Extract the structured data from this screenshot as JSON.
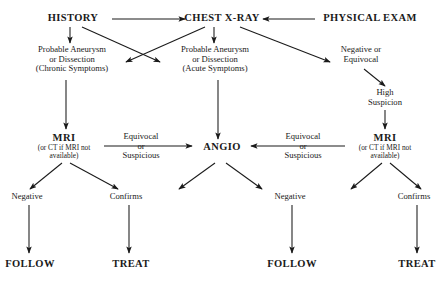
{
  "diagram": {
    "stroke_color": "#1a1a1a",
    "background_color": "#ffffff",
    "nodes": [
      {
        "id": "history",
        "label": "HISTORY",
        "x": 73,
        "y": 19,
        "style": "bold"
      },
      {
        "id": "chest-xray",
        "label": "CHEST X-RAY",
        "x": 222,
        "y": 19,
        "style": "bold"
      },
      {
        "id": "physical-exam",
        "label": "PHYSICAL EXAM",
        "x": 370,
        "y": 19,
        "style": "bold"
      },
      {
        "id": "chronic",
        "line1": "Probable Aneurysm",
        "line2": "or Dissection",
        "line3": "(Chronic Symptoms)",
        "x": 72,
        "y": 52,
        "style": "plain"
      },
      {
        "id": "acute",
        "line1": "Probable Aneurysm",
        "line2": "or Dissection",
        "line3": "(Acute Symptoms)",
        "x": 215,
        "y": 52,
        "style": "plain"
      },
      {
        "id": "negative-equiv",
        "line1": "Negative or",
        "line2": "Equivocal",
        "line3": "",
        "x": 361,
        "y": 52,
        "style": "plain"
      },
      {
        "id": "high-suspicion",
        "line1": "High",
        "line2": "Suspicion",
        "line3": "",
        "x": 385,
        "y": 93,
        "style": "plain"
      },
      {
        "id": "mri-left",
        "label": "MRI",
        "sub1": "(or CT if MRI not",
        "sub2": "available)",
        "x": 64,
        "y": 138,
        "style": "bold"
      },
      {
        "id": "angio",
        "label": "ANGIO",
        "sub1": "",
        "sub2": "",
        "x": 222,
        "y": 147,
        "style": "bold"
      },
      {
        "id": "mri-right",
        "label": "MRI",
        "sub1": "(or CT if MRI not",
        "sub2": "available)",
        "x": 385,
        "y": 138,
        "style": "bold"
      },
      {
        "id": "equiv-left",
        "line1": "Equivocal",
        "line2": "or",
        "line3": "Suspicious",
        "x": 141,
        "y": 138,
        "style": "plain"
      },
      {
        "id": "equiv-right",
        "line1": "Equivocal",
        "line2": "or",
        "line3": "Suspicious",
        "x": 303,
        "y": 138,
        "style": "plain"
      },
      {
        "id": "negative-left",
        "label": "Negative",
        "x": 27,
        "y": 197,
        "style": "plain"
      },
      {
        "id": "confirms-left",
        "label": "Confirms",
        "x": 126,
        "y": 197,
        "style": "plain"
      },
      {
        "id": "negative-right",
        "label": "Negative",
        "x": 290,
        "y": 197,
        "style": "plain"
      },
      {
        "id": "confirms-right",
        "label": "Confirms",
        "x": 414,
        "y": 197,
        "style": "plain"
      },
      {
        "id": "follow-left",
        "label": "FOLLOW",
        "x": 30,
        "y": 263,
        "style": "bold"
      },
      {
        "id": "treat-left",
        "label": "TREAT",
        "x": 131,
        "y": 263,
        "style": "bold"
      },
      {
        "id": "follow-right",
        "label": "FOLLOW",
        "x": 292,
        "y": 263,
        "style": "bold"
      },
      {
        "id": "treat-right",
        "label": "TREAT",
        "x": 417,
        "y": 263,
        "style": "bold"
      }
    ],
    "edges": [
      {
        "id": "history-to-chest-xray",
        "from": "history",
        "to": "chest-xray",
        "x1": 112,
        "y1": 19,
        "x2": 185,
        "y2": 19
      },
      {
        "id": "physical-exam-to-chest-xray",
        "from": "physical-exam",
        "to": "chest-xray",
        "x1": 315,
        "y1": 19,
        "x2": 263,
        "y2": 19
      },
      {
        "id": "history-to-chronic",
        "from": "history",
        "to": "chronic",
        "x1": 70,
        "y1": 27,
        "x2": 70,
        "y2": 43
      },
      {
        "id": "history-to-acute",
        "from": "history",
        "to": "acute",
        "x1": 82,
        "y1": 27,
        "x2": 160,
        "y2": 62
      },
      {
        "id": "chest-xray-to-chronic",
        "from": "chest-xray",
        "to": "chronic",
        "x1": 205,
        "y1": 27,
        "x2": 126,
        "y2": 62
      },
      {
        "id": "chest-xray-to-acute",
        "from": "chest-xray",
        "to": "acute",
        "x1": 214,
        "y1": 27,
        "x2": 214,
        "y2": 43
      },
      {
        "id": "chest-xray-to-negative",
        "from": "chest-xray",
        "to": "negative-equiv",
        "x1": 240,
        "y1": 27,
        "x2": 330,
        "y2": 62
      },
      {
        "id": "negative-to-high-suspicion",
        "from": "negative-equiv",
        "to": "high-suspicion",
        "x1": 364,
        "y1": 69,
        "x2": 385,
        "y2": 86
      },
      {
        "id": "chronic-to-mri-left",
        "from": "chronic",
        "to": "mri-left",
        "x1": 66,
        "y1": 80,
        "x2": 66,
        "y2": 129
      },
      {
        "id": "acute-to-angio",
        "from": "acute",
        "to": "angio",
        "x1": 218,
        "y1": 80,
        "x2": 218,
        "y2": 139
      },
      {
        "id": "high-suspicion-to-mri-right",
        "from": "high-suspicion",
        "to": "mri-right",
        "x1": 385,
        "y1": 110,
        "x2": 385,
        "y2": 129
      },
      {
        "id": "mri-left-to-angio",
        "from": "mri-left",
        "to": "angio",
        "x1": 104,
        "y1": 146,
        "x2": 192,
        "y2": 146
      },
      {
        "id": "mri-right-to-angio",
        "from": "mri-right",
        "to": "angio",
        "x1": 345,
        "y1": 146,
        "x2": 251,
        "y2": 146
      },
      {
        "id": "mri-left-to-negative",
        "from": "mri-left",
        "to": "negative-left",
        "x1": 62,
        "y1": 163,
        "x2": 30,
        "y2": 189
      },
      {
        "id": "mri-left-to-confirms",
        "from": "mri-left",
        "to": "confirms-left",
        "x1": 70,
        "y1": 163,
        "x2": 118,
        "y2": 189
      },
      {
        "id": "angio-to-negative",
        "from": "angio",
        "to": "negative-right",
        "x1": 215,
        "y1": 163,
        "x2": 179,
        "y2": 189
      },
      {
        "id": "angio-to-confirms",
        "from": "angio",
        "to": "confirms-left",
        "x1": 226,
        "y1": 163,
        "x2": 262,
        "y2": 189
      },
      {
        "id": "mri-right-to-negative",
        "from": "mri-right",
        "to": "negative-right",
        "x1": 382,
        "y1": 163,
        "x2": 351,
        "y2": 189
      },
      {
        "id": "mri-right-to-confirms",
        "from": "mri-right",
        "to": "confirms-right",
        "x1": 390,
        "y1": 163,
        "x2": 421,
        "y2": 189
      },
      {
        "id": "negative-left-to-follow",
        "from": "negative-left",
        "to": "follow-left",
        "x1": 29,
        "y1": 205,
        "x2": 29,
        "y2": 253
      },
      {
        "id": "confirms-left-to-treat",
        "from": "confirms-left",
        "to": "treat-left",
        "x1": 129,
        "y1": 205,
        "x2": 129,
        "y2": 253
      },
      {
        "id": "negative-right-to-follow",
        "from": "negative-right",
        "to": "follow-right",
        "x1": 292,
        "y1": 205,
        "x2": 292,
        "y2": 253
      },
      {
        "id": "confirms-right-to-treat",
        "from": "confirms-right",
        "to": "treat-right",
        "x1": 417,
        "y1": 205,
        "x2": 417,
        "y2": 253
      }
    ]
  }
}
